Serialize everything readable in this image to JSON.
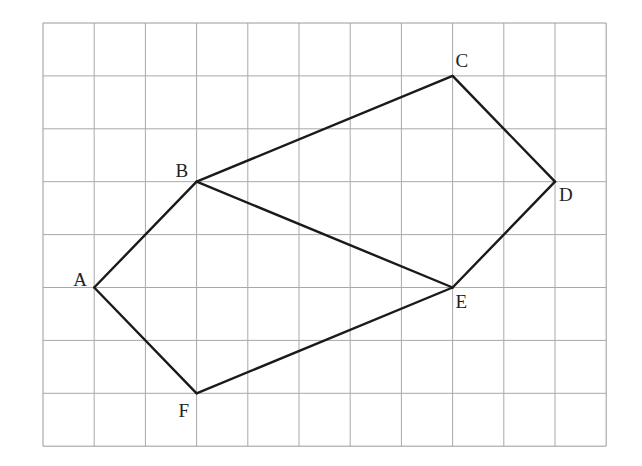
{
  "diagram": {
    "type": "grid-polygon",
    "grid": {
      "columns": 11,
      "rows": 8,
      "origin_px": [
        43,
        23
      ],
      "cell_w": 51.2,
      "cell_h": 52.9,
      "line_color": "#a8a8a8",
      "border_color": "#9a9a9a"
    },
    "stroke_color": "#1a1a1a",
    "points": [
      {
        "name": "A",
        "col": 1,
        "row": 5,
        "label_dx": -21,
        "label_dy": -2
      },
      {
        "name": "B",
        "col": 3,
        "row": 3,
        "label_dx": -21,
        "label_dy": -5
      },
      {
        "name": "C",
        "col": 8,
        "row": 1,
        "label_dx": 3,
        "label_dy": -9
      },
      {
        "name": "D",
        "col": 10,
        "row": 3,
        "label_dx": 4,
        "label_dy": 19
      },
      {
        "name": "E",
        "col": 8,
        "row": 5,
        "label_dx": 3,
        "label_dy": 20
      },
      {
        "name": "F",
        "col": 3,
        "row": 7,
        "label_dx": -18,
        "label_dy": 24
      }
    ],
    "segments": [
      [
        "A",
        "B"
      ],
      [
        "B",
        "C"
      ],
      [
        "C",
        "D"
      ],
      [
        "D",
        "E"
      ],
      [
        "E",
        "F"
      ],
      [
        "F",
        "A"
      ],
      [
        "B",
        "E"
      ]
    ]
  }
}
